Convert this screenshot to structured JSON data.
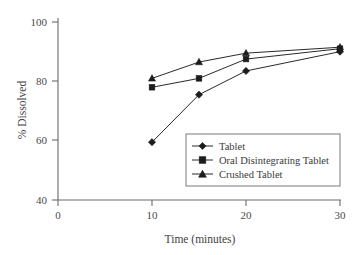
{
  "chart_data": {
    "type": "line",
    "title": "",
    "xlabel": "Time (minutes)",
    "ylabel": "% Dissolved",
    "xlim": [
      0,
      30
    ],
    "ylim": [
      40,
      100
    ],
    "xticks": [
      0,
      10,
      20,
      30
    ],
    "yticks": [
      40,
      60,
      80,
      100
    ],
    "xtick_labels": [
      "0",
      "10",
      "20",
      "30"
    ],
    "ytick_labels": [
      "40",
      "60",
      "80",
      "100"
    ],
    "grid": false,
    "legend_position": "center-right-inside",
    "x": [
      10,
      15,
      20,
      30
    ],
    "series": [
      {
        "name": "Tablet",
        "marker": "diamond",
        "values": [
          59.5,
          75.5,
          83.5,
          90.0
        ]
      },
      {
        "name": "Oral Disintegrating Tablet",
        "marker": "square",
        "values": [
          78.0,
          81.0,
          87.5,
          91.0
        ]
      },
      {
        "name": "Crushed Tablet",
        "marker": "triangle",
        "values": [
          81.0,
          86.5,
          89.5,
          91.5
        ]
      }
    ],
    "colors": {
      "line": "#2a2a2a",
      "marker": "#1c1c1c",
      "axis": "#6b6b6b",
      "text": "#3a3a3a",
      "background": "#ffffff"
    }
  },
  "axes": {
    "x_title": "Time (minutes)",
    "y_title": "% Dissolved"
  },
  "legend": {
    "entries": [
      {
        "label": "Tablet"
      },
      {
        "label": "Oral Disintegrating Tablet"
      },
      {
        "label": "Crushed Tablet"
      }
    ]
  }
}
